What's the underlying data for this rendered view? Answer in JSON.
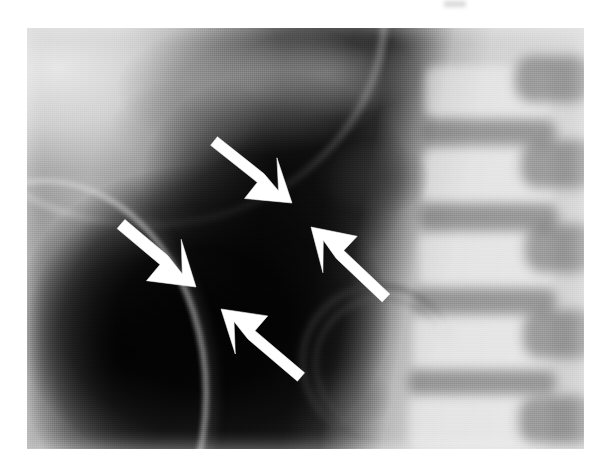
{
  "figure": {
    "kind": "radiograph",
    "modality": "plain-film X-ray",
    "view": "lateral thoraco-lumbar / chest-abdomen",
    "caption": "",
    "plate": {
      "left": 27,
      "top": 28,
      "width": 557,
      "height": 421,
      "background_hex": "#9a9a9a",
      "border_hex": "#ffffff"
    },
    "page_background_hex": "#ffffff"
  },
  "annotations": {
    "arrow_color_hex": "#ffffff",
    "arrow_outline_hex": "#f2f2f2",
    "count": 4,
    "arrows": [
      {
        "id": "arrow-upper",
        "label": "upper arrow",
        "direction": "down-right",
        "tail": {
          "x": 214,
          "y": 141
        },
        "tip": {
          "x": 292,
          "y": 203
        },
        "shaft_width": 11,
        "head_length": 40,
        "head_half_width": 26
      },
      {
        "id": "arrow-left",
        "label": "left arrow",
        "direction": "down-right",
        "tail": {
          "x": 121,
          "y": 224
        },
        "tip": {
          "x": 196,
          "y": 287
        },
        "shaft_width": 12,
        "head_length": 42,
        "head_half_width": 27
      },
      {
        "id": "arrow-right",
        "label": "right arrow",
        "direction": "up-left",
        "tail": {
          "x": 386,
          "y": 298
        },
        "tip": {
          "x": 311,
          "y": 227
        },
        "shaft_width": 11,
        "head_length": 40,
        "head_half_width": 25
      },
      {
        "id": "arrow-lower",
        "label": "lower arrow",
        "direction": "up-left",
        "tail": {
          "x": 301,
          "y": 377
        },
        "tip": {
          "x": 221,
          "y": 309
        },
        "shaft_width": 11,
        "head_length": 40,
        "head_half_width": 25
      }
    ]
  },
  "anatomy": {
    "regions": [
      {
        "name": "bright-apex",
        "description": "bright upper-left soft tissue / lung apex band",
        "tone_hex": "#ebebeb"
      },
      {
        "name": "upper-mass",
        "description": "mottled grey mass across upper centre",
        "tone_hex": "#969696"
      },
      {
        "name": "dark-gas",
        "description": "very dark gas / lucent region lower-left and centre",
        "tone_hex": "#141414"
      },
      {
        "name": "spine-column",
        "description": "bright vertebral bodies on the right",
        "tone_hex": "#f2f2f2"
      },
      {
        "name": "intervertebral-discs",
        "description": "darker horizontal disc spaces",
        "tone_hex": "#6c6c6c"
      },
      {
        "name": "rib-arc",
        "description": "curved bright rib margin lower-left",
        "tone_hex": "#d7d7d7"
      },
      {
        "name": "diaphragm-curve",
        "description": "curved dark margin right of centre",
        "tone_hex": "#3c3c3c"
      }
    ],
    "vertebrae": [
      {
        "left": 398,
        "top": 38,
        "width": 126,
        "height": 52
      },
      {
        "left": 396,
        "top": 120,
        "width": 130,
        "height": 56
      },
      {
        "left": 392,
        "top": 204,
        "width": 134,
        "height": 58
      },
      {
        "left": 386,
        "top": 286,
        "width": 138,
        "height": 58
      },
      {
        "left": 382,
        "top": 366,
        "width": 140,
        "height": 56
      }
    ],
    "discs": [
      {
        "left": 392,
        "top": 92,
        "width": 138,
        "height": 24
      },
      {
        "left": 390,
        "top": 176,
        "width": 142,
        "height": 26
      },
      {
        "left": 384,
        "top": 260,
        "width": 146,
        "height": 26
      },
      {
        "left": 380,
        "top": 342,
        "width": 150,
        "height": 24
      }
    ],
    "spinous_processes": [
      {
        "left": 488,
        "top": 28,
        "width": 78,
        "height": 46
      },
      {
        "left": 494,
        "top": 112,
        "width": 76,
        "height": 48
      },
      {
        "left": 498,
        "top": 196,
        "width": 72,
        "height": 48
      },
      {
        "left": 496,
        "top": 282,
        "width": 74,
        "height": 48
      },
      {
        "left": 492,
        "top": 368,
        "width": 76,
        "height": 48
      }
    ]
  }
}
